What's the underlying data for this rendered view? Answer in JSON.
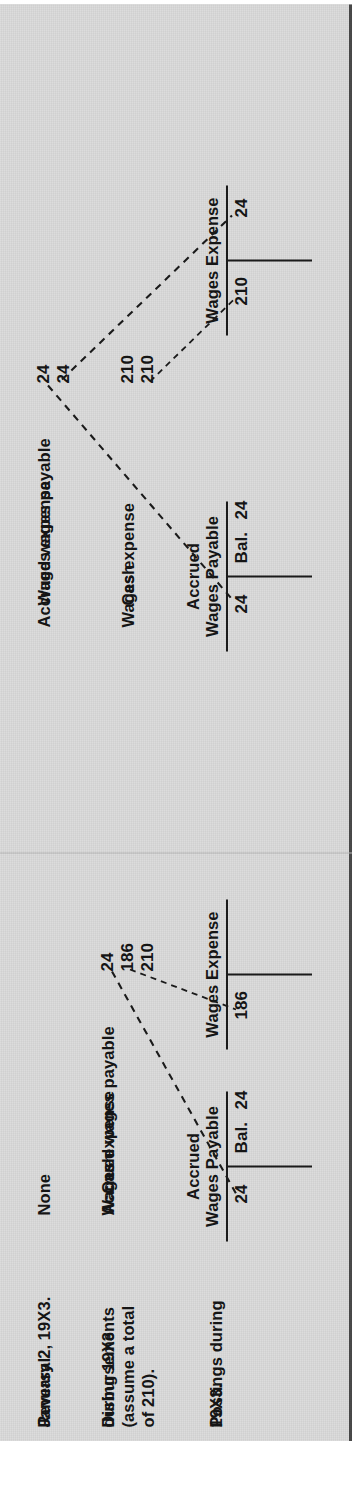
{
  "document": {
    "kind": "accounting-illustration",
    "orientation": "rotated-90-ccw",
    "background_color": "#dcdcdc",
    "ink_color": "#161616"
  },
  "row_labels": [
    {
      "id": "reversal",
      "lines": [
        "Reversal",
        "January 2, 19X3."
      ]
    },
    {
      "id": "disbursements",
      "lines": [
        "Disbursements",
        "during 19X3",
        "(assume a total",
        "of 210)."
      ]
    },
    {
      "id": "postings",
      "lines": [
        "Postings during",
        "19X3."
      ]
    }
  ],
  "columns": [
    {
      "id": "without-reversing-entry",
      "reversal_entry": {
        "lines": [
          "None"
        ],
        "amounts": []
      },
      "disbursement_entry": {
        "lines": [
          "Accrued wages payable",
          "Wages expense",
          "Cash"
        ],
        "amounts": [
          "24",
          "186",
          "210"
        ]
      },
      "t_accounts": [
        {
          "id": "accrued-wages-payable",
          "title_lines": [
            "Accrued",
            "Wages Payable"
          ],
          "debit": {
            "label": "",
            "amount": "24"
          },
          "credit": {
            "label": "Bal.",
            "amount": "24"
          }
        },
        {
          "id": "wages-expense",
          "title_lines": [
            "Wages Expense"
          ],
          "debit": {
            "label": "",
            "amount": "186"
          },
          "credit": {
            "label": "",
            "amount": ""
          }
        }
      ]
    },
    {
      "id": "with-reversing-entry",
      "reversal_entry": {
        "lines": [
          "Accrued wages payable",
          "Wages expense"
        ],
        "amounts": [
          "24",
          "24"
        ]
      },
      "disbursement_entry": {
        "lines": [
          "Wages expense",
          "Cash"
        ],
        "amounts": [
          "210",
          "210"
        ]
      },
      "t_accounts": [
        {
          "id": "accrued-wages-payable",
          "title_lines": [
            "Accrued",
            "Wages Payable"
          ],
          "debit": {
            "label": "",
            "amount": "24"
          },
          "credit": {
            "label": "Bal.",
            "amount": "24"
          }
        },
        {
          "id": "wages-expense",
          "title_lines": [
            "Wages Expense"
          ],
          "debit": {
            "label": "",
            "amount": "210"
          },
          "credit": {
            "label": "",
            "amount": "24"
          }
        }
      ]
    }
  ]
}
